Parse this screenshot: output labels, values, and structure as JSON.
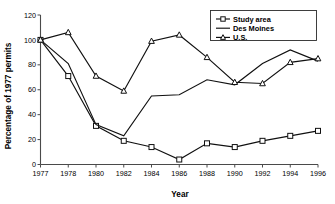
{
  "chart_data": {
    "type": "line",
    "title": "",
    "xlabel": "Year",
    "ylabel": "Percentage of 1977 permits",
    "categories": [
      "1977",
      "1978",
      "1980",
      "1982",
      "1984",
      "1986",
      "1988",
      "1990",
      "1992",
      "1994",
      "1996"
    ],
    "xtick_labels": [
      "1977",
      "1978",
      "1980",
      "1982",
      "1984",
      "1986",
      "1988",
      "1990",
      "1992",
      "1994",
      "1996"
    ],
    "ytick_labels": [
      "0",
      "20",
      "40",
      "60",
      "80",
      "100",
      "120"
    ],
    "yticks": [
      0,
      20,
      40,
      60,
      80,
      100,
      120
    ],
    "ylim": [
      0,
      120
    ],
    "grid": false,
    "legend_position": "top-right",
    "series": [
      {
        "name": "Study area",
        "marker": "open-square",
        "values": [
          100,
          71,
          31,
          19,
          14,
          4,
          17,
          14,
          19,
          23,
          27
        ]
      },
      {
        "name": "Des Moines",
        "marker": "none",
        "values": [
          100,
          81,
          32,
          23,
          55,
          56,
          68,
          64,
          81,
          92,
          83
        ]
      },
      {
        "name": "U.S.",
        "marker": "open-triangle",
        "values": [
          100,
          106,
          71,
          59,
          99,
          104,
          86,
          66,
          65,
          82,
          85
        ]
      }
    ]
  },
  "legend": {
    "entries": [
      {
        "label": "Study area",
        "marker": "open-square"
      },
      {
        "label": "Des Moines",
        "marker": "none"
      },
      {
        "label": "U.S.",
        "marker": "open-triangle"
      }
    ]
  }
}
